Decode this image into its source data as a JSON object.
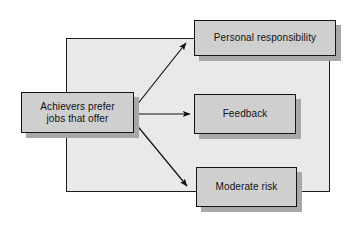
{
  "diagram": {
    "title": "Achievers prefer jobs that offer",
    "type": "flow-diagram",
    "orientation": "left-to-right",
    "colors": {
      "page_background": "#ffffff",
      "backdrop_fill": "#e9e9e9",
      "backdrop_border": "#1c1c1c",
      "node_fill": "#cfcfcf",
      "node_border": "#141414",
      "node_shadow": "#a8a8a8",
      "arrow": "#111111",
      "text": "#111111"
    },
    "source": {
      "id": "achievers-prefer",
      "label": "Achievers prefer\njobs that offer",
      "line1": "Achievers prefer",
      "line2": "jobs that offer"
    },
    "targets": [
      {
        "id": "personal-responsibility",
        "label": "Personal responsibility",
        "position": "top"
      },
      {
        "id": "feedback",
        "label": "Feedback",
        "position": "middle"
      },
      {
        "id": "moderate-risk",
        "label": "Moderate risk",
        "position": "bottom"
      }
    ],
    "connectors": [
      {
        "id": "arrow-to-personal-responsibility",
        "from": "achievers-prefer",
        "to": "personal-responsibility",
        "direction": "up-right"
      },
      {
        "id": "arrow-to-feedback",
        "from": "achievers-prefer",
        "to": "feedback",
        "direction": "right"
      },
      {
        "id": "arrow-to-moderate-risk",
        "from": "achievers-prefer",
        "to": "moderate-risk",
        "direction": "down-right"
      }
    ]
  }
}
